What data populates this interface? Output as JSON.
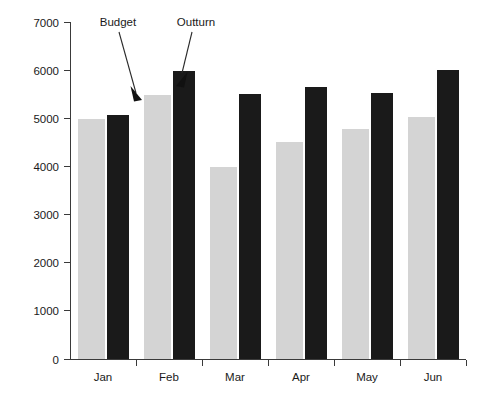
{
  "chart_data": {
    "type": "bar",
    "title": "",
    "xlabel": "",
    "ylabel": "",
    "categories": [
      "Jan",
      "Feb",
      "Mar",
      "Apr",
      "May",
      "Jun"
    ],
    "series": [
      {
        "name": "Budget",
        "color": "#d4d4d4",
        "values": [
          5000,
          5500,
          4000,
          4520,
          4800,
          5040
        ]
      },
      {
        "name": "Outturn",
        "color": "#1a1a1a",
        "values": [
          5080,
          6000,
          5530,
          5670,
          5550,
          6030
        ]
      }
    ],
    "ylim": [
      0,
      7000
    ],
    "yticks": [
      0,
      1000,
      2000,
      3000,
      4000,
      5000,
      6000,
      7000
    ],
    "ytick_labels": [
      "0",
      "1000",
      "2000",
      "3000",
      "4000",
      "5000",
      "6000",
      "7000"
    ],
    "grid": false,
    "legend_position": "annotation-callouts"
  },
  "annotations": [
    {
      "label": "Budget",
      "target_series": "Budget",
      "target_category": "Feb"
    },
    {
      "label": "Outturn",
      "target_series": "Outturn",
      "target_category": "Feb"
    }
  ],
  "axis": {
    "y_label_0": "0",
    "y_label_1000": "1000",
    "y_label_2000": "2000",
    "y_label_3000": "3000",
    "y_label_4000": "4000",
    "y_label_5000": "5000",
    "y_label_6000": "6000",
    "y_label_7000": "7000",
    "x_label_jan": "Jan",
    "x_label_feb": "Feb",
    "x_label_mar": "Mar",
    "x_label_apr": "Apr",
    "x_label_may": "May",
    "x_label_jun": "Jun"
  },
  "colors": {
    "budget_bar": "#d4d4d4",
    "outturn_bar": "#1a1a1a",
    "axis": "#3a3a3a",
    "text": "#1a1a1a",
    "background": "#ffffff"
  }
}
